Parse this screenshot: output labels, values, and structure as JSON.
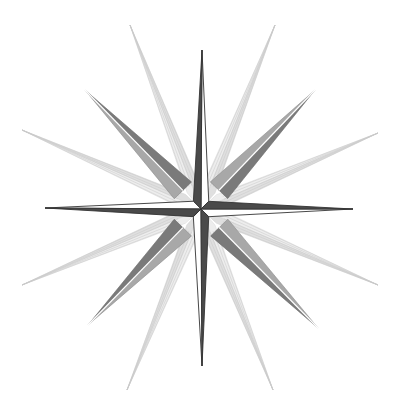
{
  "figure": {
    "width": 403,
    "height": 413,
    "background": "#ffffff",
    "center": [
      201,
      209
    ]
  },
  "colors": {
    "cardinal_dark": "#4a4a4a",
    "cardinal_outline": "#333333",
    "intercardinal_dark": "#7a7a7a",
    "intercardinal_light": "#a8a8a8",
    "faint_ray": "#c8c8c8"
  },
  "points": {
    "cardinal": [
      {
        "name": "north",
        "tip": [
          202,
          50
        ]
      },
      {
        "name": "east",
        "tip": [
          353,
          209
        ]
      },
      {
        "name": "south",
        "tip": [
          202,
          366
        ]
      },
      {
        "name": "west",
        "tip": [
          45,
          208
        ]
      }
    ],
    "intercardinal": [
      {
        "name": "northeast",
        "tip": [
          315,
          90
        ]
      },
      {
        "name": "southeast",
        "tip": [
          318,
          328
        ]
      },
      {
        "name": "southwest",
        "tip": [
          88,
          325
        ]
      },
      {
        "name": "northwest",
        "tip": [
          85,
          90
        ]
      }
    ],
    "faint_rays": [
      {
        "name": "nnw",
        "tip": [
          130,
          25
        ]
      },
      {
        "name": "nne",
        "tip": [
          275,
          25
        ]
      },
      {
        "name": "ene",
        "tip": [
          378,
          133
        ]
      },
      {
        "name": "ese",
        "tip": [
          378,
          285
        ]
      },
      {
        "name": "sse",
        "tip": [
          273,
          390
        ]
      },
      {
        "name": "ssw",
        "tip": [
          127,
          390
        ]
      },
      {
        "name": "wsw",
        "tip": [
          22,
          285
        ]
      },
      {
        "name": "wnw",
        "tip": [
          22,
          130
        ]
      }
    ]
  }
}
